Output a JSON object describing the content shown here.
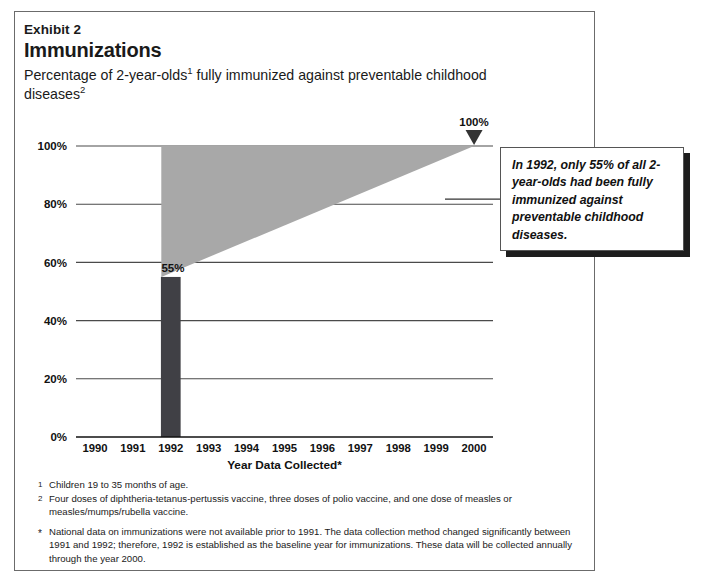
{
  "header": {
    "exhibit_label": "Exhibit 2",
    "title": "Immunizations",
    "subtitle_part1": "Percentage of 2-year-olds",
    "subtitle_sup1": "1",
    "subtitle_part2": " fully immunized against preventable childhood diseases",
    "subtitle_sup2": "2"
  },
  "callout": {
    "text": "In 1992, only 55% of all 2-year-olds had been fully immunized against preventable childhood diseases."
  },
  "footnotes": [
    {
      "marker": "1",
      "text": "Children 19 to 35 months of age."
    },
    {
      "marker": "2",
      "text": "Four doses of diphtheria-tetanus-pertussis vaccine, three doses of polio vaccine, and one dose of measles or measles/mumps/rubella vaccine."
    }
  ],
  "note": {
    "marker": "*",
    "text": "National data on immunizations were not available prior to 1991.  The data collection method changed significantly between 1991 and 1992; therefore, 1992 is established as the baseline year for immunizations.  These data will be collected annually through the year 2000."
  },
  "colors": {
    "bar": "#404045",
    "wedge": "#a8a8a8",
    "gridline": "#4a4a4a",
    "frame": "#6b6b6b",
    "shadow": "#1d1d1d"
  },
  "chart_data": {
    "type": "bar",
    "title": "Immunizations",
    "subtitle": "Percentage of 2-year-olds fully immunized against preventable childhood diseases",
    "xlabel": "Year Data Collected*",
    "ylabel": "",
    "categories": [
      "1990",
      "1991",
      "1992",
      "1993",
      "1994",
      "1995",
      "1996",
      "1997",
      "1998",
      "1999",
      "2000"
    ],
    "values": [
      null,
      null,
      55,
      null,
      null,
      null,
      null,
      null,
      null,
      null,
      null
    ],
    "value_labels": {
      "1992": "55%"
    },
    "ylim": [
      0,
      100
    ],
    "ytick_labels": [
      "0%",
      "20%",
      "40%",
      "60%",
      "80%",
      "100%"
    ],
    "ytick_values": [
      0,
      20,
      40,
      60,
      80,
      100
    ],
    "grid": true,
    "legend": "none",
    "annotations": [
      {
        "name": "target-marker",
        "label": "100%",
        "x": "2000",
        "y": 100,
        "marker": "down-triangle"
      },
      {
        "name": "projection-wedge",
        "from_x": "1992",
        "from_y": 55,
        "to_x": "2000",
        "to_y": 100,
        "top_y": 100,
        "fill": "#a8a8a8",
        "description": "Shaded goal wedge from 55% in 1992 rising to 100% by 2000"
      }
    ]
  }
}
